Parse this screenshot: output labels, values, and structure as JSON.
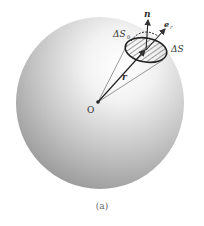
{
  "figure": {
    "caption": "(a)",
    "labels": {
      "center": "O",
      "radius": "r",
      "normal": "n",
      "unit_radial": "e",
      "unit_radial_sub": "r",
      "area": "ΔS",
      "projected_area": "ΔS",
      "projected_area_sub": "0"
    },
    "colors": {
      "sphere_light": "#ffffff",
      "sphere_mid": "#d4d4d4",
      "sphere_dark": "#8a8a8a",
      "lines": "#333333"
    }
  }
}
